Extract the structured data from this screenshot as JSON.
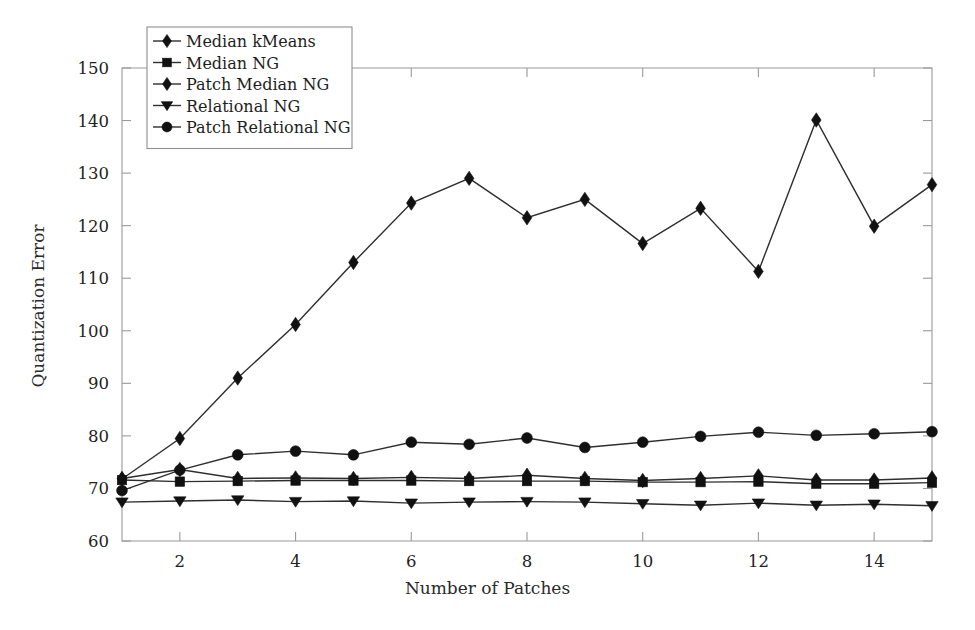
{
  "chart_data": {
    "type": "line",
    "title": "",
    "xlabel": "Number of Patches",
    "ylabel": "Quantization Error",
    "xlim": [
      1,
      15
    ],
    "ylim": [
      60,
      150
    ],
    "xticks": [
      2,
      4,
      6,
      8,
      10,
      12,
      14
    ],
    "yticks": [
      60,
      70,
      80,
      90,
      100,
      110,
      120,
      130,
      140,
      150
    ],
    "grid": false,
    "legend_position": "top-left",
    "x": [
      1,
      2,
      3,
      4,
      5,
      6,
      7,
      8,
      9,
      10,
      11,
      12,
      13,
      14,
      15
    ],
    "series": [
      {
        "name": "Median kMeans",
        "marker": "diamond",
        "values": [
          71.8,
          79.5,
          91.0,
          101.2,
          113.0,
          124.3,
          129.0,
          121.5,
          125.0,
          116.6,
          123.3,
          111.3,
          140.1,
          119.9,
          127.8
        ]
      },
      {
        "name": "Median NG",
        "marker": "square",
        "values": [
          71.6,
          71.3,
          71.4,
          71.5,
          71.5,
          71.5,
          71.4,
          71.4,
          71.4,
          71.2,
          71.2,
          71.3,
          70.9,
          70.9,
          71.1
        ]
      },
      {
        "name": "Patch Median NG",
        "marker": "diamond",
        "values": [
          71.9,
          73.6,
          71.9,
          72.0,
          71.9,
          72.1,
          71.9,
          72.5,
          71.9,
          71.5,
          71.9,
          72.4,
          71.6,
          71.6,
          72.0
        ]
      },
      {
        "name": "Relational NG",
        "marker": "triangle-down",
        "values": [
          67.4,
          67.6,
          67.8,
          67.5,
          67.6,
          67.2,
          67.4,
          67.5,
          67.4,
          67.1,
          66.8,
          67.2,
          66.8,
          67.0,
          66.7
        ]
      },
      {
        "name": "Patch Relational NG",
        "marker": "circle",
        "values": [
          69.6,
          73.5,
          76.4,
          77.1,
          76.4,
          78.8,
          78.4,
          79.6,
          77.8,
          78.8,
          79.9,
          80.7,
          80.1,
          80.4,
          80.8
        ]
      }
    ]
  },
  "legend": {
    "entries": [
      {
        "label": "Median kMeans"
      },
      {
        "label": "Median NG"
      },
      {
        "label": "Patch Median NG"
      },
      {
        "label": "Relational NG"
      },
      {
        "label": "Patch Relational NG"
      }
    ]
  },
  "colors": {
    "line": "#2e2e2e",
    "marker": "#111111",
    "axis": "#9a9a9a",
    "text": "#1e1e1e",
    "background": "#ffffff"
  }
}
